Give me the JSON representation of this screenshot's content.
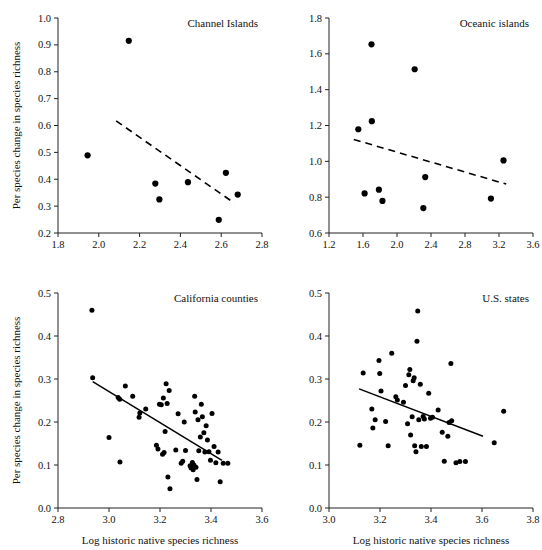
{
  "figure": {
    "shared_xlabel": "Log historic native species richness",
    "shared_ylabel": "Per species change in species richness"
  },
  "chart_data": [
    {
      "type": "scatter",
      "title": "Channel Islands",
      "xlabel": "",
      "ylabel": "Per species change in species richness",
      "xlim": [
        1.8,
        2.8
      ],
      "ylim": [
        0.2,
        1.0
      ],
      "xticks": [
        1.8,
        2.0,
        2.2,
        2.4,
        2.6,
        2.8
      ],
      "xticklabels": [
        "1.8",
        "2.0",
        "2.2",
        "2.4",
        "2.6",
        "2.8"
      ],
      "yticks": [
        0.2,
        0.3,
        0.4,
        0.5,
        0.6,
        0.7,
        0.8,
        0.9,
        1.0
      ],
      "yticklabels": [
        "0.2",
        "0.3",
        "0.4",
        "0.5",
        "0.6",
        "0.7",
        "0.8",
        "0.9",
        "1.0"
      ],
      "grid": false,
      "legend": "none",
      "points": [
        {
          "x": 1.945,
          "y": 0.489
        },
        {
          "x": 2.147,
          "y": 0.915
        },
        {
          "x": 2.277,
          "y": 0.384
        },
        {
          "x": 2.297,
          "y": 0.325
        },
        {
          "x": 2.437,
          "y": 0.389
        },
        {
          "x": 2.588,
          "y": 0.249
        },
        {
          "x": 2.623,
          "y": 0.424
        },
        {
          "x": 2.681,
          "y": 0.343
        }
      ],
      "trendline": {
        "style": "dashed",
        "x_start": 2.085,
        "y_start": 0.617,
        "x_end": 2.665,
        "y_end": 0.311
      }
    },
    {
      "type": "scatter",
      "title": "Oceanic islands",
      "xlabel": "",
      "ylabel": "",
      "xlim": [
        1.2,
        3.6
      ],
      "ylim": [
        0.6,
        1.8
      ],
      "xticks": [
        1.2,
        1.6,
        2.0,
        2.4,
        2.8,
        3.2,
        3.6
      ],
      "xticklabels": [
        "1.2",
        "1.6",
        "2.0",
        "2.4",
        "2.8",
        "3.2",
        "3.6"
      ],
      "yticks": [
        0.6,
        0.8,
        1.0,
        1.2,
        1.4,
        1.6,
        1.8
      ],
      "yticklabels": [
        "0.6",
        "0.8",
        "1.0",
        "1.2",
        "1.4",
        "1.6",
        "1.8"
      ],
      "grid": false,
      "legend": "none",
      "points": [
        {
          "x": 1.545,
          "y": 1.179
        },
        {
          "x": 1.619,
          "y": 0.821
        },
        {
          "x": 1.7,
          "y": 1.653
        },
        {
          "x": 1.704,
          "y": 1.224
        },
        {
          "x": 1.787,
          "y": 0.842
        },
        {
          "x": 1.829,
          "y": 0.779
        },
        {
          "x": 2.208,
          "y": 1.514
        },
        {
          "x": 2.31,
          "y": 0.739
        },
        {
          "x": 2.332,
          "y": 0.912
        },
        {
          "x": 3.105,
          "y": 0.792
        },
        {
          "x": 3.253,
          "y": 1.005
        }
      ],
      "trendline": {
        "style": "dashed",
        "x_start": 1.492,
        "y_start": 1.122,
        "x_end": 3.285,
        "y_end": 0.873
      }
    },
    {
      "type": "scatter",
      "title": "California counties",
      "xlabel": "Log historic native species richness",
      "ylabel": "Per species change in species richness",
      "xlim": [
        2.8,
        3.6
      ],
      "ylim": [
        0.0,
        0.5
      ],
      "xticks": [
        2.8,
        3.0,
        3.2,
        3.4,
        3.6
      ],
      "xticklabels": [
        "2.8",
        "3.0",
        "3.2",
        "3.4",
        "3.6"
      ],
      "yticks": [
        0.0,
        0.1,
        0.2,
        0.3,
        0.4,
        0.5
      ],
      "yticklabels": [
        "0.0",
        "0.1",
        "0.2",
        "0.3",
        "0.4",
        "0.5"
      ],
      "grid": false,
      "legend": "none",
      "points": [
        {
          "x": 2.933,
          "y": 0.46
        },
        {
          "x": 2.936,
          "y": 0.303
        },
        {
          "x": 3.0,
          "y": 0.164
        },
        {
          "x": 3.036,
          "y": 0.257
        },
        {
          "x": 3.042,
          "y": 0.253
        },
        {
          "x": 3.043,
          "y": 0.107
        },
        {
          "x": 3.064,
          "y": 0.284
        },
        {
          "x": 3.093,
          "y": 0.26
        },
        {
          "x": 3.118,
          "y": 0.211
        },
        {
          "x": 3.121,
          "y": 0.221
        },
        {
          "x": 3.144,
          "y": 0.23
        },
        {
          "x": 3.186,
          "y": 0.146
        },
        {
          "x": 3.192,
          "y": 0.137
        },
        {
          "x": 3.198,
          "y": 0.241
        },
        {
          "x": 3.205,
          "y": 0.24
        },
        {
          "x": 3.21,
          "y": 0.125
        },
        {
          "x": 3.213,
          "y": 0.256
        },
        {
          "x": 3.216,
          "y": 0.129
        },
        {
          "x": 3.22,
          "y": 0.178
        },
        {
          "x": 3.224,
          "y": 0.289
        },
        {
          "x": 3.228,
          "y": 0.243
        },
        {
          "x": 3.231,
          "y": 0.072
        },
        {
          "x": 3.236,
          "y": 0.273
        },
        {
          "x": 3.239,
          "y": 0.045
        },
        {
          "x": 3.262,
          "y": 0.135
        },
        {
          "x": 3.271,
          "y": 0.219
        },
        {
          "x": 3.283,
          "y": 0.104
        },
        {
          "x": 3.289,
          "y": 0.109
        },
        {
          "x": 3.295,
          "y": 0.2
        },
        {
          "x": 3.3,
          "y": 0.134
        },
        {
          "x": 3.318,
          "y": 0.098
        },
        {
          "x": 3.322,
          "y": 0.093
        },
        {
          "x": 3.327,
          "y": 0.106
        },
        {
          "x": 3.33,
          "y": 0.089
        },
        {
          "x": 3.333,
          "y": 0.1
        },
        {
          "x": 3.336,
          "y": 0.26
        },
        {
          "x": 3.338,
          "y": 0.223
        },
        {
          "x": 3.341,
          "y": 0.095
        },
        {
          "x": 3.345,
          "y": 0.066
        },
        {
          "x": 3.349,
          "y": 0.205
        },
        {
          "x": 3.352,
          "y": 0.133
        },
        {
          "x": 3.358,
          "y": 0.165
        },
        {
          "x": 3.362,
          "y": 0.241
        },
        {
          "x": 3.366,
          "y": 0.212
        },
        {
          "x": 3.372,
          "y": 0.175
        },
        {
          "x": 3.376,
          "y": 0.13
        },
        {
          "x": 3.381,
          "y": 0.191
        },
        {
          "x": 3.386,
          "y": 0.158
        },
        {
          "x": 3.392,
          "y": 0.131
        },
        {
          "x": 3.398,
          "y": 0.111
        },
        {
          "x": 3.404,
          "y": 0.22
        },
        {
          "x": 3.412,
          "y": 0.143
        },
        {
          "x": 3.419,
          "y": 0.105
        },
        {
          "x": 3.428,
          "y": 0.13
        },
        {
          "x": 3.436,
          "y": 0.061
        },
        {
          "x": 3.448,
          "y": 0.104
        },
        {
          "x": 3.466,
          "y": 0.104
        }
      ],
      "trendline": {
        "style": "solid",
        "x_start": 2.936,
        "y_start": 0.294,
        "x_end": 3.443,
        "y_end": 0.111
      }
    },
    {
      "type": "scatter",
      "title": "U.S. states",
      "xlabel": "Log historic native species richness",
      "ylabel": "",
      "xlim": [
        3.0,
        3.8
      ],
      "ylim": [
        0.0,
        0.5
      ],
      "xticks": [
        3.0,
        3.2,
        3.4,
        3.6,
        3.8
      ],
      "xticklabels": [
        "3.0",
        "3.2",
        "3.4",
        "3.6",
        "3.8"
      ],
      "yticks": [
        0.0,
        0.1,
        0.2,
        0.3,
        0.4,
        0.5
      ],
      "yticklabels": [
        "0.0",
        "0.1",
        "0.2",
        "0.3",
        "0.4",
        "0.5"
      ],
      "grid": false,
      "legend": "none",
      "points": [
        {
          "x": 3.121,
          "y": 0.146
        },
        {
          "x": 3.134,
          "y": 0.314
        },
        {
          "x": 3.168,
          "y": 0.23
        },
        {
          "x": 3.172,
          "y": 0.186
        },
        {
          "x": 3.181,
          "y": 0.205
        },
        {
          "x": 3.196,
          "y": 0.343
        },
        {
          "x": 3.199,
          "y": 0.313
        },
        {
          "x": 3.204,
          "y": 0.272
        },
        {
          "x": 3.222,
          "y": 0.201
        },
        {
          "x": 3.232,
          "y": 0.145
        },
        {
          "x": 3.246,
          "y": 0.36
        },
        {
          "x": 3.262,
          "y": 0.259
        },
        {
          "x": 3.268,
          "y": 0.251
        },
        {
          "x": 3.292,
          "y": 0.246
        },
        {
          "x": 3.3,
          "y": 0.285
        },
        {
          "x": 3.308,
          "y": 0.196
        },
        {
          "x": 3.313,
          "y": 0.31
        },
        {
          "x": 3.317,
          "y": 0.322
        },
        {
          "x": 3.32,
          "y": 0.17
        },
        {
          "x": 3.326,
          "y": 0.212
        },
        {
          "x": 3.33,
          "y": 0.296
        },
        {
          "x": 3.334,
          "y": 0.303
        },
        {
          "x": 3.336,
          "y": 0.145
        },
        {
          "x": 3.341,
          "y": 0.131
        },
        {
          "x": 3.345,
          "y": 0.388
        },
        {
          "x": 3.348,
          "y": 0.458
        },
        {
          "x": 3.352,
          "y": 0.205
        },
        {
          "x": 3.358,
          "y": 0.288
        },
        {
          "x": 3.362,
          "y": 0.143
        },
        {
          "x": 3.369,
          "y": 0.213
        },
        {
          "x": 3.374,
          "y": 0.207
        },
        {
          "x": 3.382,
          "y": 0.143
        },
        {
          "x": 3.391,
          "y": 0.267
        },
        {
          "x": 3.398,
          "y": 0.209
        },
        {
          "x": 3.406,
          "y": 0.211
        },
        {
          "x": 3.428,
          "y": 0.228
        },
        {
          "x": 3.444,
          "y": 0.176
        },
        {
          "x": 3.452,
          "y": 0.109
        },
        {
          "x": 3.466,
          "y": 0.167
        },
        {
          "x": 3.471,
          "y": 0.199
        },
        {
          "x": 3.478,
          "y": 0.336
        },
        {
          "x": 3.481,
          "y": 0.203
        },
        {
          "x": 3.498,
          "y": 0.105
        },
        {
          "x": 3.513,
          "y": 0.108
        },
        {
          "x": 3.535,
          "y": 0.108
        },
        {
          "x": 3.648,
          "y": 0.152
        },
        {
          "x": 3.685,
          "y": 0.225
        }
      ],
      "trendline": {
        "style": "solid",
        "x_start": 3.118,
        "y_start": 0.277,
        "x_end": 3.604,
        "y_end": 0.167
      }
    }
  ]
}
